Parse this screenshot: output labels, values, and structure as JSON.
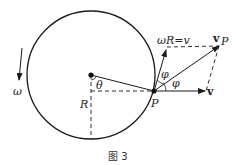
{
  "diagram": {
    "caption": "图 3",
    "labels": {
      "omega": "ω",
      "theta": "θ",
      "radius": "R",
      "point": "P",
      "tangential": "ωR=v",
      "v_p": "v",
      "v_p_sub": "P",
      "v": "v",
      "phi_upper": "φ",
      "phi_lower": "φ"
    },
    "colors": {
      "stroke": "#1a1a1a",
      "background": "#ffffff"
    }
  }
}
